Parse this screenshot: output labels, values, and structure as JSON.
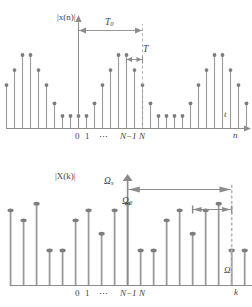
{
  "figure": {
    "title": "",
    "panels": [
      {
        "id": "time-domain",
        "yaxis_label": "|x(n)|",
        "xaxis_label_upper": "t",
        "xaxis_label_lower": "n",
        "ticks": [
          "0",
          "1",
          "⋯",
          "N−1",
          "N"
        ],
        "annotations": [
          {
            "name": "period-span",
            "symbol": "T",
            "subscript": "0"
          },
          {
            "name": "sample-span",
            "symbol": "T",
            "subscript": ""
          }
        ]
      },
      {
        "id": "frequency-domain",
        "yaxis_label": "|X(k)|",
        "xaxis_label_upper": "Ω",
        "xaxis_label_lower": "k",
        "ticks": [
          "0",
          "1",
          "⋯",
          "N−1",
          "N"
        ],
        "annotations": [
          {
            "name": "sampling-frequency-span",
            "symbol": "Ω",
            "subscript": "s"
          },
          {
            "name": "fundamental-frequency-span",
            "symbol": "Ω",
            "subscript": "0"
          }
        ]
      }
    ]
  },
  "colors": {
    "stem_line": "#9a9a9a",
    "stem_dot": "#7d7d7d",
    "axis": "#8c8c8c",
    "dashed_guide": "#b4b4b4",
    "text": "#444444",
    "background": "#ffffff"
  },
  "chart_data": [
    {
      "type": "stem",
      "id": "time-domain",
      "title": "",
      "xlabel": "n",
      "ylabel": "|x(n)|",
      "xlabel_secondary": "t",
      "grid": false,
      "legend": "none",
      "period_samples": 8,
      "x_tick_labels": [
        "0",
        "1",
        "⋯",
        "N−1",
        "N"
      ],
      "x_tick_indices": [
        0,
        1,
        4,
        7,
        8
      ],
      "x": [
        -10,
        -9,
        -8,
        -7,
        -6,
        -5,
        -4,
        -3,
        -2,
        -1,
        0,
        1,
        2,
        3,
        4,
        5,
        6,
        7,
        8,
        9,
        10,
        11,
        12,
        13,
        14,
        15,
        16,
        17,
        18,
        19,
        20,
        21
      ],
      "values": [
        0.3,
        0.52,
        0.7,
        0.88,
        0.88,
        0.7,
        0.52,
        0.3,
        0.15,
        0.15,
        0.15,
        0.15,
        0.3,
        0.52,
        0.7,
        0.88,
        0.88,
        0.7,
        0.52,
        0.3,
        0.15,
        0.15,
        0.15,
        0.15,
        0.3,
        0.52,
        0.7,
        0.88,
        0.88,
        0.7,
        0.52,
        0.3
      ],
      "ylim": [
        0,
        1.0
      ],
      "annotations": [
        {
          "label": "T₀",
          "kind": "double-arrow",
          "from_index": 0,
          "to_index": 8
        },
        {
          "label": "T",
          "kind": "double-arrow",
          "from_index": 6,
          "to_index": 7
        }
      ]
    },
    {
      "type": "stem",
      "id": "frequency-domain",
      "title": "",
      "xlabel": "k",
      "ylabel": "|X(k)|",
      "xlabel_secondary": "Ω",
      "grid": false,
      "legend": "none",
      "period_samples": 8,
      "x_tick_labels": [
        "0",
        "1",
        "⋯",
        "N−1",
        "N"
      ],
      "x_tick_indices": [
        0,
        1,
        4,
        7,
        8
      ],
      "x": [
        -10,
        -9,
        -8,
        -7,
        -6,
        -5,
        -4,
        -3,
        -2,
        -1,
        0,
        1,
        2,
        3,
        4,
        5,
        6,
        7,
        8,
        9,
        10,
        11,
        12,
        13,
        14,
        15,
        16,
        17,
        18,
        19,
        20,
        21
      ],
      "values": [
        0.62,
        0.9,
        0.78,
        0.98,
        0.42,
        0.42,
        0.78,
        0.9,
        0.62,
        0.9,
        0.98,
        0.42,
        0.42,
        0.78,
        0.9,
        0.62,
        0.9,
        0.98,
        0.42,
        0.42,
        0.78,
        0.9,
        0.62,
        0.9,
        0.98,
        0.42,
        0.42,
        0.78,
        0.9,
        0.62,
        0.9,
        0.98
      ],
      "ylim": [
        0,
        1.0
      ],
      "annotations": [
        {
          "label": "Ωₛ",
          "kind": "double-arrow",
          "from_index": 0,
          "to_index": 8
        },
        {
          "label": "Ω₀",
          "kind": "double-arrow",
          "from_index": 6,
          "to_index": 8
        }
      ]
    }
  ]
}
